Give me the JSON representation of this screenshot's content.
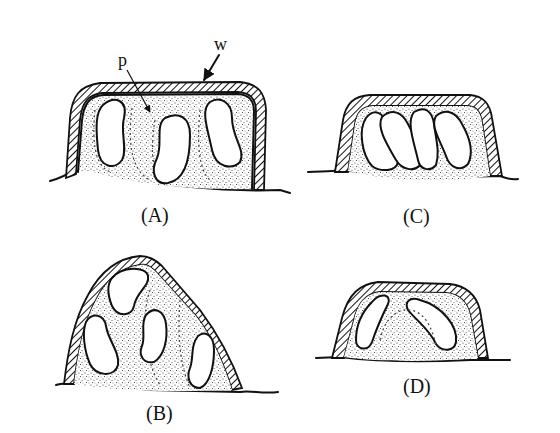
{
  "diagram": {
    "annotations": [
      {
        "id": "p",
        "label": "p",
        "target": "stippled tissue region"
      },
      {
        "id": "w",
        "label": "w",
        "target": "hatched outer wall layer"
      }
    ],
    "panels": [
      {
        "id": "A",
        "caption": "(A)",
        "cavities": 3
      },
      {
        "id": "B",
        "caption": "(B)",
        "cavities": 4
      },
      {
        "id": "C",
        "caption": "(C)",
        "cavities": 4
      },
      {
        "id": "D",
        "caption": "(D)",
        "cavities": 2
      }
    ],
    "colors": {
      "ink": "#111111",
      "background": "#ffffff"
    }
  }
}
